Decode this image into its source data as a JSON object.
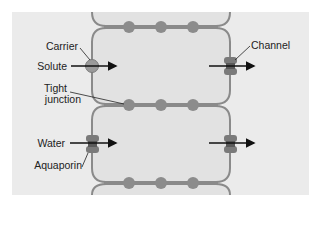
{
  "diagram": {
    "labels": {
      "carrier": "Carrier",
      "solute": "Solute",
      "tight_junction_line1": "Tight",
      "tight_junction_line2": "junction",
      "water": "Water",
      "aquaporin": "Aquaporin",
      "channel": "Channel"
    },
    "colors": {
      "background": "#ebebeb",
      "cell_fill": "#e4e4e4",
      "membrane": "#8a8a8a",
      "junction_dot": "#8c8c8c",
      "protein": "#777777",
      "arrow": "#111111"
    }
  }
}
